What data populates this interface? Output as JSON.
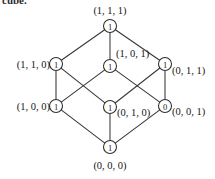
{
  "figure": {
    "caption_fragment": "cube.",
    "type": "3-cube lattice diagram",
    "width": 215,
    "height": 179,
    "edge_color": "#363636",
    "node_fill": "#ffffff",
    "node_stroke": "#2e2e2e",
    "text_color": "#161616"
  },
  "nodes": [
    {
      "id": "n111",
      "label": "(1, 1, 1)",
      "value": "1",
      "cx": 110,
      "cy": 26,
      "r": 6.5,
      "label_x": 110,
      "label_y": 10,
      "label_anchor": "mid"
    },
    {
      "id": "n110",
      "label": "(1, 1, 0)",
      "value": "1",
      "cx": 56,
      "cy": 64,
      "r": 6.5,
      "label_x": 50,
      "label_y": 64,
      "label_anchor": "end"
    },
    {
      "id": "n101",
      "label": "(1, 0, 1)",
      "value": "1",
      "cx": 110,
      "cy": 66,
      "r": 6.5,
      "label_x": 116,
      "label_y": 53,
      "label_anchor": "start"
    },
    {
      "id": "n011",
      "label": "(0, 1, 1)",
      "value": "1",
      "cx": 165,
      "cy": 64,
      "r": 6.5,
      "label_x": 172,
      "label_y": 70,
      "label_anchor": "start"
    },
    {
      "id": "n100",
      "label": "(1, 0, 0)",
      "value": "1",
      "cx": 56,
      "cy": 106,
      "r": 6.5,
      "label_x": 50,
      "label_y": 106,
      "label_anchor": "end"
    },
    {
      "id": "n010",
      "label": "(0, 1, 0)",
      "value": "1",
      "cx": 110,
      "cy": 107,
      "r": 6.5,
      "label_x": 117,
      "label_y": 112,
      "label_anchor": "start"
    },
    {
      "id": "n001",
      "label": "(0, 0, 1)",
      "value": "0",
      "cx": 165,
      "cy": 106,
      "r": 6.5,
      "label_x": 172,
      "label_y": 111,
      "label_anchor": "start"
    },
    {
      "id": "n000",
      "label": "(0, 0, 0)",
      "value": "1",
      "cx": 110,
      "cy": 147,
      "r": 6.5,
      "label_x": 110,
      "label_y": 165,
      "label_anchor": "mid"
    }
  ],
  "edges": [
    {
      "id": "e-111-110",
      "from": "n111",
      "to": "n110"
    },
    {
      "id": "e-111-101",
      "from": "n111",
      "to": "n101"
    },
    {
      "id": "e-111-011",
      "from": "n111",
      "to": "n011"
    },
    {
      "id": "e-110-100",
      "from": "n110",
      "to": "n100"
    },
    {
      "id": "e-110-010",
      "from": "n110",
      "to": "n010"
    },
    {
      "id": "e-101-100",
      "from": "n101",
      "to": "n100"
    },
    {
      "id": "e-101-001",
      "from": "n101",
      "to": "n001"
    },
    {
      "id": "e-011-010",
      "from": "n011",
      "to": "n010"
    },
    {
      "id": "e-011-001",
      "from": "n011",
      "to": "n001"
    },
    {
      "id": "e-100-000",
      "from": "n100",
      "to": "n000"
    },
    {
      "id": "e-010-000",
      "from": "n010",
      "to": "n000"
    },
    {
      "id": "e-001-000",
      "from": "n001",
      "to": "n000"
    }
  ]
}
